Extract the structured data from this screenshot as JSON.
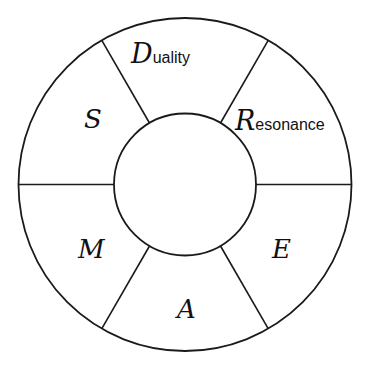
{
  "diagram": {
    "title": "",
    "colors": {
      "stroke": "#1a1a1a",
      "background": "#ffffff",
      "text": "#111111"
    },
    "segments": [
      {
        "position": "top",
        "initial": "D",
        "rest": "uality"
      },
      {
        "position": "upper-right",
        "initial": "R",
        "rest": "esonance"
      },
      {
        "position": "lower-right",
        "initial": "E",
        "rest": ""
      },
      {
        "position": "bottom",
        "initial": "A",
        "rest": ""
      },
      {
        "position": "lower-left",
        "initial": "M",
        "rest": ""
      },
      {
        "position": "upper-left",
        "initial": "S",
        "rest": ""
      }
    ],
    "center_label": ""
  }
}
